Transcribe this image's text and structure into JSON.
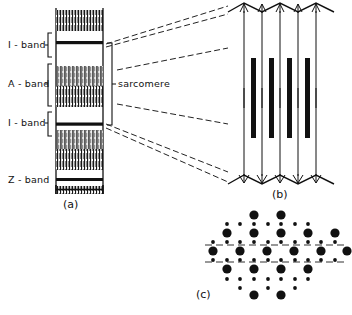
{
  "figure": {
    "background_color": "#ffffff",
    "ink_color": "#111111"
  },
  "panel_a": {
    "tag": "(a)",
    "description": "Light-microscope view of a myofibril showing banding pattern",
    "labels": [
      {
        "id": "i-band-upper",
        "text": "I - band",
        "y": 45
      },
      {
        "id": "a-band",
        "text": "A - band",
        "y": 84
      },
      {
        "id": "i-band-lower",
        "text": "I - band",
        "y": 123
      },
      {
        "id": "z-band",
        "text": "Z - band",
        "y": 180
      }
    ],
    "sarcomere_label": "sarcomere",
    "fibril": {
      "x": 55,
      "y": 8,
      "width": 48,
      "height": 185
    },
    "bands": [
      {
        "name": "striated-block",
        "type": "striated",
        "top": 10,
        "height": 21
      },
      {
        "name": "z-line-1",
        "type": "line",
        "top": 41,
        "height": 3
      },
      {
        "name": "i-band-gap-1",
        "type": "gap",
        "top": 44,
        "height": 22
      },
      {
        "name": "a-band-block",
        "type": "striated",
        "top": 66,
        "height": 41
      },
      {
        "name": "i-band-gap-2",
        "type": "gap",
        "top": 107,
        "height": 16
      },
      {
        "name": "z-line-2",
        "type": "line",
        "top": 123,
        "height": 3
      },
      {
        "name": "striated-block-2",
        "type": "striated",
        "top": 130,
        "height": 40
      },
      {
        "name": "z-line-3",
        "type": "line",
        "top": 178,
        "height": 3
      },
      {
        "name": "striated-block-3",
        "type": "striated",
        "top": 186,
        "height": 7
      }
    ]
  },
  "panel_b": {
    "tag": "(b)",
    "description": "Longitudinal arrangement of thick (myosin) and thin (actin) filaments between Z-lines",
    "thin_filament_count": 5,
    "thick_filament_count": 4,
    "region": {
      "x": 228,
      "y": 10,
      "width": 108,
      "height": 175
    },
    "z_line_top_y": 18,
    "z_line_bottom_y": 178,
    "thick_filament": {
      "top": 62,
      "bottom": 138,
      "width": 5
    }
  },
  "panel_c": {
    "tag": "(c)",
    "description": "Cross-sectional hexagonal lattice: large dots are thick filaments, small dots are thin filaments",
    "thick_filament_dot_radius": 4.6,
    "thin_filament_dot_radius": 1.9,
    "section_line_count": 2,
    "center": {
      "x": 263,
      "y": 258
    }
  },
  "connectors": {
    "description": "Dashed guide lines projecting the sarcomere from panel (a) to panel (b)",
    "style": "dashed",
    "count": 6
  }
}
